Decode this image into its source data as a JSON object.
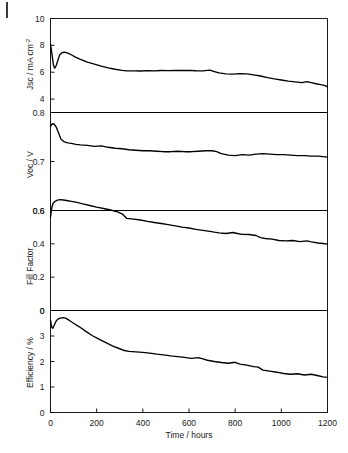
{
  "figure": {
    "corner_mark_name": "figure-edge-mark"
  },
  "chart_data": {
    "type": "line",
    "title": "",
    "subtitle": "",
    "xlabel": "Time / hours",
    "grid": false,
    "legend": "none",
    "layout": "4 stacked panels sharing a common x-axis",
    "xlim": [
      0,
      1200
    ],
    "xticks": [
      0,
      200,
      400,
      600,
      800,
      1000,
      1200
    ],
    "xticklabels": [
      "0",
      "200",
      "400",
      "600",
      "800",
      "1000",
      "1200"
    ],
    "panels": [
      {
        "id": "jsc",
        "ylabel": "Jsc / mA cm",
        "ylabel_super": "-2",
        "ylabel_full": "Jsc / mA cm-2",
        "ylim": [
          3,
          10
        ],
        "yticks": [
          4,
          6,
          8,
          10
        ],
        "yticklabels": [
          "4",
          "6",
          "8",
          "10"
        ],
        "series": [
          {
            "name": "Jsc",
            "x": [
              0,
              6,
              12,
              18,
              25,
              32,
              40,
              50,
              60,
              75,
              90,
              110,
              130,
              160,
              190,
              220,
              250,
              280,
              310,
              330,
              360,
              390,
              420,
              450,
              480,
              510,
              540,
              570,
              600,
              630,
              660,
              690,
              710,
              730,
              760,
              790,
              820,
              850,
              880,
              910,
              940,
              970,
              1000,
              1030,
              1060,
              1090,
              1110,
              1130,
              1150,
              1170,
              1190,
              1200
            ],
            "y": [
              8.1,
              7.4,
              6.6,
              6.3,
              6.5,
              6.9,
              7.3,
              7.45,
              7.5,
              7.42,
              7.3,
              7.1,
              6.95,
              6.75,
              6.6,
              6.45,
              6.32,
              6.22,
              6.14,
              6.1,
              6.1,
              6.09,
              6.12,
              6.1,
              6.13,
              6.12,
              6.14,
              6.13,
              6.14,
              6.11,
              6.1,
              6.15,
              6.05,
              5.95,
              5.88,
              5.86,
              5.9,
              5.88,
              5.8,
              5.72,
              5.6,
              5.5,
              5.42,
              5.34,
              5.28,
              5.22,
              5.3,
              5.22,
              5.14,
              5.08,
              5.0,
              4.9
            ]
          }
        ]
      },
      {
        "id": "voc",
        "ylabel": "Voc / V",
        "ylim": [
          0.6,
          0.8
        ],
        "yticks": [
          0.6,
          0.7,
          0.8
        ],
        "yticklabels": [
          "0.6",
          "0.7",
          "0.8"
        ],
        "series": [
          {
            "name": "Voc",
            "x": [
              0,
              8,
              16,
              25,
              35,
              45,
              60,
              75,
              90,
              110,
              130,
              160,
              190,
              220,
              250,
              280,
              310,
              340,
              370,
              400,
              430,
              460,
              490,
              520,
              550,
              580,
              610,
              640,
              670,
              700,
              720,
              740,
              770,
              800,
              830,
              860,
              890,
              920,
              950,
              980,
              1010,
              1040,
              1070,
              1100,
              1130,
              1160,
              1180,
              1200
            ],
            "y": [
              0.772,
              0.777,
              0.776,
              0.77,
              0.758,
              0.746,
              0.74,
              0.738,
              0.737,
              0.735,
              0.734,
              0.733,
              0.731,
              0.732,
              0.729,
              0.727,
              0.726,
              0.724,
              0.723,
              0.722,
              0.722,
              0.721,
              0.72,
              0.72,
              0.721,
              0.72,
              0.72,
              0.721,
              0.722,
              0.722,
              0.72,
              0.716,
              0.713,
              0.712,
              0.714,
              0.713,
              0.715,
              0.716,
              0.715,
              0.714,
              0.714,
              0.713,
              0.712,
              0.712,
              0.711,
              0.711,
              0.71,
              0.709
            ]
          }
        ]
      },
      {
        "id": "fill-factor",
        "ylabel": "Fill Factor",
        "ylim": [
          0,
          0.6
        ],
        "yticks": [
          0,
          0.2,
          0.4,
          0.6
        ],
        "yticklabels": [
          "0",
          "0.2",
          "0.4",
          "0.6"
        ],
        "series": [
          {
            "name": "Fill Factor",
            "x": [
              0,
              6,
              12,
              20,
              30,
              42,
              55,
              70,
              90,
              110,
              140,
              170,
              200,
              230,
              260,
              290,
              310,
              330,
              360,
              390,
              420,
              450,
              480,
              510,
              540,
              570,
              600,
              630,
              660,
              690,
              710,
              730,
              760,
              790,
              810,
              830,
              860,
              890,
              910,
              930,
              960,
              990,
              1020,
              1050,
              1080,
              1110,
              1130,
              1160,
              1180,
              1200
            ],
            "y": [
              0.56,
              0.62,
              0.645,
              0.655,
              0.662,
              0.665,
              0.663,
              0.66,
              0.655,
              0.65,
              0.64,
              0.63,
              0.62,
              0.612,
              0.603,
              0.592,
              0.58,
              0.553,
              0.548,
              0.543,
              0.535,
              0.528,
              0.522,
              0.515,
              0.508,
              0.5,
              0.495,
              0.487,
              0.481,
              0.475,
              0.47,
              0.466,
              0.462,
              0.468,
              0.462,
              0.457,
              0.456,
              0.45,
              0.437,
              0.432,
              0.428,
              0.42,
              0.418,
              0.42,
              0.413,
              0.418,
              0.412,
              0.405,
              0.402,
              0.398
            ]
          }
        ]
      },
      {
        "id": "efficiency",
        "ylabel": "Efficiency / %",
        "ylim": [
          0,
          4
        ],
        "yticks": [
          0,
          1,
          2,
          3
        ],
        "yticklabels": [
          "0",
          "1",
          "2",
          "3"
        ],
        "top_tick_label": "0",
        "series": [
          {
            "name": "Efficiency",
            "x": [
              0,
              5,
              10,
              16,
              24,
              32,
              42,
              55,
              65,
              80,
              100,
              125,
              150,
              180,
              210,
              240,
              270,
              300,
              320,
              340,
              370,
              400,
              430,
              460,
              490,
              520,
              550,
              580,
              610,
              640,
              660,
              680,
              710,
              740,
              770,
              800,
              820,
              850,
              880,
              900,
              920,
              950,
              980,
              1010,
              1040,
              1070,
              1100,
              1130,
              1160,
              1180,
              1200
            ],
            "y": [
              3.62,
              3.35,
              3.3,
              3.42,
              3.58,
              3.66,
              3.7,
              3.72,
              3.7,
              3.62,
              3.5,
              3.36,
              3.2,
              3.02,
              2.88,
              2.74,
              2.6,
              2.5,
              2.43,
              2.4,
              2.38,
              2.36,
              2.33,
              2.29,
              2.26,
              2.22,
              2.19,
              2.16,
              2.12,
              2.15,
              2.1,
              2.05,
              2.0,
              1.96,
              1.93,
              1.97,
              1.9,
              1.86,
              1.8,
              1.78,
              1.66,
              1.62,
              1.58,
              1.53,
              1.5,
              1.52,
              1.47,
              1.5,
              1.44,
              1.4,
              1.38
            ]
          }
        ]
      }
    ]
  }
}
